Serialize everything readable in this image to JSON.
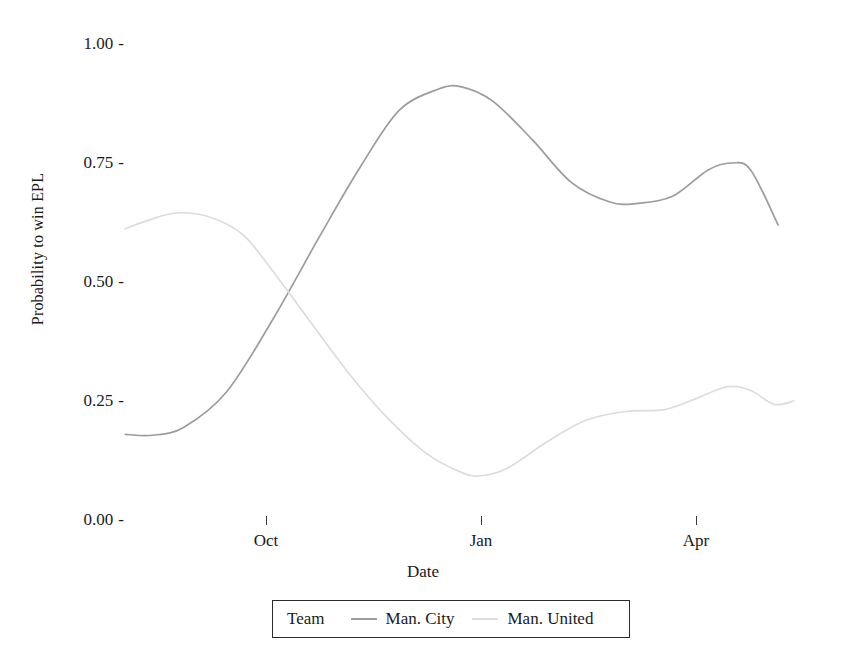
{
  "chart_data": {
    "type": "line",
    "title": "",
    "xlabel": "Date",
    "ylabel": "Probability to win EPL",
    "ylim": [
      0.0,
      1.0
    ],
    "y_ticks": [
      "0.00",
      "0.25",
      "0.50",
      "0.75",
      "1.00"
    ],
    "y_tick_values": [
      0.0,
      0.25,
      0.5,
      0.75,
      1.0
    ],
    "x_ticks": [
      "Oct",
      "Jan",
      "Apr"
    ],
    "grid": false,
    "legend_position": "bottom",
    "legend_title": "Team",
    "series": [
      {
        "name": "Man. City",
        "color": "#9c9c9c",
        "x": [
          "Aug",
          "Sep",
          "Oct",
          "Nov",
          "Dec",
          "Jan",
          "Feb",
          "Mar",
          "Apr",
          "May"
        ],
        "x_frac": [
          0.0,
          0.09,
          0.18,
          0.27,
          0.36,
          0.46,
          0.55,
          0.64,
          0.73,
          1.0
        ],
        "values": [
          0.18,
          0.19,
          0.42,
          0.8,
          0.91,
          0.73,
          0.665,
          0.75,
          0.3,
          0.82
        ],
        "detail_points": [
          {
            "x_frac": 0.0,
            "y": 0.18
          },
          {
            "x_frac": 0.035,
            "y": 0.178
          },
          {
            "x_frac": 0.075,
            "y": 0.195
          },
          {
            "x_frac": 0.13,
            "y": 0.27
          },
          {
            "x_frac": 0.19,
            "y": 0.425
          },
          {
            "x_frac": 0.25,
            "y": 0.6
          },
          {
            "x_frac": 0.3,
            "y": 0.74
          },
          {
            "x_frac": 0.35,
            "y": 0.86
          },
          {
            "x_frac": 0.4,
            "y": 0.905
          },
          {
            "x_frac": 0.43,
            "y": 0.91
          },
          {
            "x_frac": 0.47,
            "y": 0.88
          },
          {
            "x_frac": 0.52,
            "y": 0.8
          },
          {
            "x_frac": 0.57,
            "y": 0.71
          },
          {
            "x_frac": 0.62,
            "y": 0.668
          },
          {
            "x_frac": 0.655,
            "y": 0.665
          },
          {
            "x_frac": 0.7,
            "y": 0.68
          },
          {
            "x_frac": 0.745,
            "y": 0.735
          },
          {
            "x_frac": 0.775,
            "y": 0.75
          },
          {
            "x_frac": 0.8,
            "y": 0.735
          },
          {
            "x_frac": 0.835,
            "y": 0.62
          },
          {
            "x_frac": 0.87,
            "y": 0.44
          },
          {
            "x_frac": 0.9,
            "y": 0.25
          },
          {
            "x_frac": 0.93,
            "y": 0.11
          },
          {
            "x_frac": 0.955,
            "y": 0.055
          },
          {
            "x_frac": 0.975,
            "y": 0.05
          },
          {
            "x_frac": 1.0,
            "y": 0.11
          },
          {
            "x_frac": 1.03,
            "y": 0.26
          },
          {
            "x_frac": 1.06,
            "y": 0.5
          },
          {
            "x_frac": 1.09,
            "y": 0.7
          },
          {
            "x_frac": 1.11,
            "y": 0.82
          }
        ],
        "min": 0.05,
        "max": 0.91,
        "start": 0.18,
        "end": 0.82
      },
      {
        "name": "Man. United",
        "color": "#dcdcdc",
        "x": [
          "Aug",
          "Sep",
          "Oct",
          "Nov",
          "Dec",
          "Jan",
          "Feb",
          "Mar",
          "Apr",
          "May"
        ],
        "x_frac": [
          0.0,
          0.09,
          0.18,
          0.27,
          0.36,
          0.46,
          0.55,
          0.64,
          0.73,
          1.0
        ],
        "values": [
          0.61,
          0.64,
          0.46,
          0.18,
          0.1,
          0.22,
          0.28,
          0.24,
          0.88,
          0.21
        ],
        "detail_points": [
          {
            "x_frac": 0.0,
            "y": 0.612
          },
          {
            "x_frac": 0.03,
            "y": 0.63
          },
          {
            "x_frac": 0.065,
            "y": 0.645
          },
          {
            "x_frac": 0.105,
            "y": 0.638
          },
          {
            "x_frac": 0.15,
            "y": 0.6
          },
          {
            "x_frac": 0.19,
            "y": 0.52
          },
          {
            "x_frac": 0.235,
            "y": 0.42
          },
          {
            "x_frac": 0.285,
            "y": 0.31
          },
          {
            "x_frac": 0.335,
            "y": 0.215
          },
          {
            "x_frac": 0.385,
            "y": 0.14
          },
          {
            "x_frac": 0.43,
            "y": 0.1
          },
          {
            "x_frac": 0.455,
            "y": 0.093
          },
          {
            "x_frac": 0.49,
            "y": 0.11
          },
          {
            "x_frac": 0.54,
            "y": 0.165
          },
          {
            "x_frac": 0.59,
            "y": 0.21
          },
          {
            "x_frac": 0.64,
            "y": 0.228
          },
          {
            "x_frac": 0.69,
            "y": 0.232
          },
          {
            "x_frac": 0.73,
            "y": 0.255
          },
          {
            "x_frac": 0.77,
            "y": 0.28
          },
          {
            "x_frac": 0.8,
            "y": 0.272
          },
          {
            "x_frac": 0.83,
            "y": 0.243
          },
          {
            "x_frac": 0.855,
            "y": 0.25
          },
          {
            "x_frac": 0.88,
            "y": 0.35
          },
          {
            "x_frac": 0.91,
            "y": 0.56
          },
          {
            "x_frac": 0.94,
            "y": 0.79
          },
          {
            "x_frac": 0.965,
            "y": 0.93
          },
          {
            "x_frac": 0.985,
            "y": 0.975
          },
          {
            "x_frac": 1.005,
            "y": 0.96
          },
          {
            "x_frac": 1.03,
            "y": 0.84
          },
          {
            "x_frac": 1.06,
            "y": 0.62
          },
          {
            "x_frac": 1.09,
            "y": 0.4
          },
          {
            "x_frac": 1.115,
            "y": 0.21
          }
        ],
        "min": 0.09,
        "max": 0.975,
        "start": 0.61,
        "end": 0.21
      }
    ]
  },
  "axes": {
    "y_title": "Probability to win EPL",
    "x_title": "Date",
    "tick_dash": "-"
  },
  "legend": {
    "title": "Team",
    "entries": [
      {
        "label": "Man. City",
        "color": "#9c9c9c"
      },
      {
        "label": "Man. United",
        "color": "#dcdcdc"
      }
    ]
  }
}
